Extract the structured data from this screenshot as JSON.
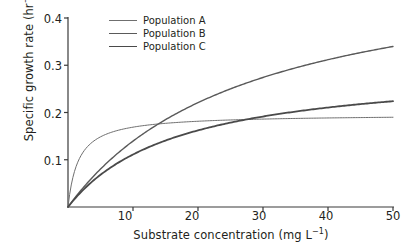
{
  "chart_data": {
    "type": "line",
    "title": "",
    "xlabel": "Substrate concentration (mg L-1)",
    "xlabel_base": "Substrate concentration (mg L",
    "xlabel_sup": "−1",
    "xlabel_tail": ")",
    "ylabel_base": "Specific growth rate  (hr",
    "ylabel_sup": "−1",
    "ylabel_tail": ")",
    "xlim": [
      0,
      50
    ],
    "ylim": [
      0,
      0.4
    ],
    "grid": false,
    "legend_position": "top-center",
    "xticks": [
      10,
      20,
      30,
      40,
      50
    ],
    "xtick_labels": [
      "10",
      "20",
      "30",
      "40",
      "50"
    ],
    "yticks": [
      0.1,
      0.2,
      0.3,
      0.4
    ],
    "ytick_labels": [
      "0.1",
      "0.2",
      "0.3",
      "0.4"
    ],
    "x": [
      0,
      1,
      2,
      3,
      4,
      5,
      6,
      7,
      8,
      9,
      10,
      12,
      14,
      16,
      18,
      20,
      22,
      24,
      26,
      28,
      30,
      32,
      34,
      36,
      38,
      40,
      42,
      44,
      46,
      48,
      50
    ],
    "series": [
      {
        "name": "Population A",
        "color": "#6f6f6f",
        "line_width": 1.0,
        "model": "Monod",
        "mu_max": 0.196,
        "ks": 1.6,
        "values": [
          0.0,
          0.075,
          0.109,
          0.128,
          0.14,
          0.148,
          0.155,
          0.159,
          0.163,
          0.166,
          0.169,
          0.173,
          0.176,
          0.178,
          0.18,
          0.181,
          0.182,
          0.183,
          0.184,
          0.185,
          0.186,
          0.186,
          0.187,
          0.187,
          0.188,
          0.188,
          0.189,
          0.189,
          0.189,
          0.19,
          0.19
        ]
      },
      {
        "name": "Population B",
        "color": "#5a5a5a",
        "line_width": 1.4,
        "model": "Monod",
        "mu_max": 0.53,
        "ks": 28.0,
        "values": [
          0.0,
          0.018,
          0.035,
          0.051,
          0.066,
          0.08,
          0.094,
          0.106,
          0.118,
          0.129,
          0.139,
          0.159,
          0.177,
          0.193,
          0.207,
          0.221,
          0.233,
          0.245,
          0.255,
          0.265,
          0.274,
          0.283,
          0.291,
          0.298,
          0.305,
          0.312,
          0.318,
          0.324,
          0.33,
          0.335,
          0.341
        ]
      },
      {
        "name": "Population C",
        "color": "#4a4a4a",
        "line_width": 1.8,
        "model": "Monod",
        "mu_max": 0.3,
        "ks": 17.0,
        "values": [
          0.0,
          0.017,
          0.032,
          0.045,
          0.057,
          0.068,
          0.078,
          0.087,
          0.096,
          0.104,
          0.111,
          0.124,
          0.135,
          0.145,
          0.154,
          0.162,
          0.169,
          0.176,
          0.181,
          0.187,
          0.191,
          0.196,
          0.2,
          0.204,
          0.207,
          0.211,
          0.214,
          0.216,
          0.219,
          0.222,
          0.224
        ]
      }
    ],
    "axis_color": "#3a3a3a"
  },
  "legend": {
    "items": [
      {
        "label": "Population A"
      },
      {
        "label": "Population B"
      },
      {
        "label": "Population C"
      }
    ]
  }
}
